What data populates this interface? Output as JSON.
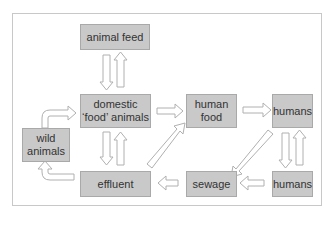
{
  "diagram": {
    "type": "flow",
    "nodes": {
      "animal_feed": "animal feed",
      "domestic_animals_l1": "domestic",
      "domestic_animals_l2": "‘food’ animals",
      "human_food_l1": "human",
      "human_food_l2": "food",
      "humans_top": "humans",
      "wild_animals_l1": "wild",
      "wild_animals_l2": "animals",
      "effluent": "effluent",
      "sewage": "sewage",
      "humans_bottom": "humans"
    },
    "edges": [
      {
        "from": "animal feed",
        "to": "domestic ‘food’ animals"
      },
      {
        "from": "domestic ‘food’ animals",
        "to": "animal feed"
      },
      {
        "from": "domestic ‘food’ animals",
        "to": "human food"
      },
      {
        "from": "human food",
        "to": "humans"
      },
      {
        "from": "humans",
        "to": "sewage"
      },
      {
        "from": "humans",
        "to": "humans (bottom)"
      },
      {
        "from": "humans (bottom)",
        "to": "humans"
      },
      {
        "from": "humans (bottom)",
        "to": "sewage"
      },
      {
        "from": "sewage",
        "to": "effluent"
      },
      {
        "from": "effluent",
        "to": "human food"
      },
      {
        "from": "effluent",
        "to": "domestic ‘food’ animals"
      },
      {
        "from": "domestic ‘food’ animals",
        "to": "effluent"
      },
      {
        "from": "effluent",
        "to": "wild animals"
      },
      {
        "from": "wild animals",
        "to": "domestic ‘food’ animals"
      }
    ],
    "colors": {
      "box_fill": "#c9c9c9",
      "box_border": "#a9a9a9",
      "arrow_stroke": "#b0b0b0",
      "frame": "#c8c8c8"
    }
  }
}
